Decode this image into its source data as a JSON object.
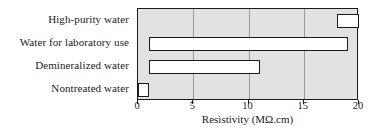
{
  "chart_data": {
    "type": "bar",
    "orientation": "horizontal",
    "bar_style": "floating-range",
    "title": "",
    "xlabel": "Resistivity (MΩ.cm)",
    "ylabel": "",
    "xlim": [
      0,
      20
    ],
    "xticks": [
      0,
      5,
      10,
      15,
      20
    ],
    "xticklabels": [
      "0",
      "5",
      "10",
      "15",
      "20"
    ],
    "grid": "vertical",
    "legend": "none",
    "categories": [
      "High-purity water",
      "Water for laboratory use",
      "Demineralized water",
      "Nontreated water"
    ],
    "ranges": [
      {
        "category": "High-purity water",
        "start": 18,
        "end": 20
      },
      {
        "category": "Water for laboratory use",
        "start": 1,
        "end": 19
      },
      {
        "category": "Demineralized water",
        "start": 1,
        "end": 11
      },
      {
        "category": "Nontreated water",
        "start": 0,
        "end": 1
      }
    ],
    "values": [
      2,
      18,
      10,
      1
    ],
    "colors": {
      "plot_background": "#e2e2e2",
      "bar_fill": "#ffffff",
      "bar_edge": "#1a1a1a",
      "gridline": "#9a9a9a",
      "axis": "#1a1a1a",
      "text": "#1a1a1a",
      "figure_background": "#ffffff"
    }
  }
}
